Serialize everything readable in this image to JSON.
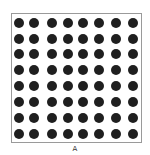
{
  "figure": {
    "label": "A",
    "grid": {
      "rows": 8,
      "cols": 8,
      "dot_color": "#1f1f1f",
      "border_color": "#9a9a9a",
      "col_centers": [
        19,
        34,
        52,
        68,
        83,
        99,
        116,
        133
      ],
      "row_centers": [
        23,
        39,
        54,
        70,
        86,
        102,
        118,
        134
      ]
    }
  }
}
